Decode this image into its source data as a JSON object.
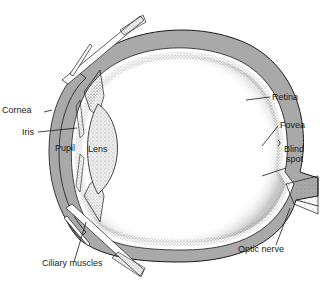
{
  "diagram": {
    "colors": {
      "background": "#ffffff",
      "sclera_fill": "#a9a9a9",
      "outline": "#1a1a1a",
      "stipple": "#555555",
      "lens_fill": "#e8e8e8"
    },
    "labels": {
      "cornea": "Cornea",
      "iris": "Iris",
      "pupil": "Pupil",
      "lens": "Lens",
      "ciliary_muscles": "Ciliary muscles",
      "retina": "Retina",
      "fovea": "Fovea",
      "blind_spot_line1": "Blind",
      "blind_spot_line2": "spot",
      "optic_nerve": "Optic nerve"
    }
  }
}
